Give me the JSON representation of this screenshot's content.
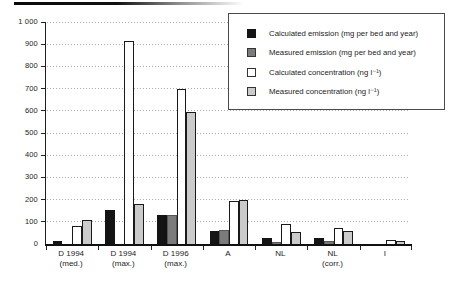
{
  "figure": {
    "background_color": "#ffffff",
    "top_rule_color": "#0a0a0a",
    "axis_color": "#111111",
    "gridline_color": "#adadad",
    "text_color": "#1c1c1c"
  },
  "chart_data": {
    "type": "bar",
    "title": "",
    "xlabel": "",
    "ylabel": "",
    "ylim": [
      0,
      1000
    ],
    "ytick_step": 100,
    "ytick_labels": [
      "0",
      "100",
      "200",
      "300",
      "400",
      "500",
      "600",
      "700",
      "800",
      "900",
      "1 000"
    ],
    "grid": "horizontal-dotted",
    "legend_position": "top-right",
    "categories": [
      [
        "D 1994",
        "(med.)"
      ],
      [
        "D 1994",
        "(max.)"
      ],
      [
        "D 1996",
        "(max.)"
      ],
      [
        "A"
      ],
      [
        "NL"
      ],
      [
        "NL",
        "(corr.)"
      ],
      [
        "I"
      ]
    ],
    "series": [
      {
        "name": "Calculated emission (mg per bed and year)",
        "fill": "#141414",
        "border": "#141414",
        "values": [
          15,
          155,
          130,
          60,
          25,
          25,
          0
        ]
      },
      {
        "name": "Measured emission (mg per bed and year)",
        "fill": "#7b7b7b",
        "border": "#555555",
        "values": [
          0,
          0,
          130,
          65,
          10,
          15,
          0
        ]
      },
      {
        "name": "Calculated concentration (ng l⁻¹)",
        "fill": "#ffffff",
        "border": "#1a1a1a",
        "values": [
          80,
          915,
          700,
          195,
          90,
          70,
          20
        ]
      },
      {
        "name": "Measured concentration (ng l⁻¹)",
        "fill": "#cbcbcb",
        "border": "#1a1a1a",
        "values": [
          110,
          180,
          595,
          200,
          55,
          60,
          15
        ]
      }
    ]
  }
}
